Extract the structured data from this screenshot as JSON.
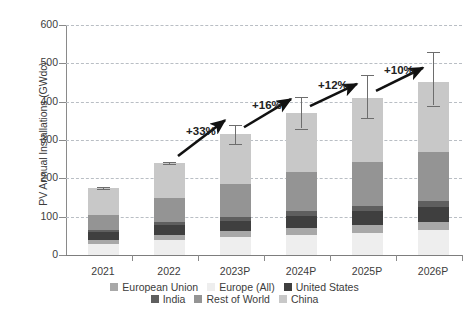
{
  "chart_data": {
    "type": "bar",
    "subtype": "stacked-bar-with-error-bars",
    "title": "",
    "xlabel": "",
    "ylabel": "PV Annual Installations (GWdc)",
    "categories": [
      "2021",
      "2022",
      "2023P",
      "2024P",
      "2025P",
      "2026P"
    ],
    "ylim": [
      0,
      600
    ],
    "yticks": [
      0,
      100,
      200,
      300,
      400,
      500,
      600
    ],
    "grid": true,
    "legend_position": "bottom",
    "stacked_order_bottom_to_top": [
      "Europe (All)",
      "European Union",
      "United States",
      "India",
      "Rest of World",
      "China"
    ],
    "series": [
      {
        "name": "Europe (All)",
        "color": "#eeeeee",
        "values": [
          28,
          38,
          46,
          52,
          58,
          64
        ]
      },
      {
        "name": "European Union",
        "color": "#a8a8a8",
        "values": [
          10,
          14,
          16,
          18,
          20,
          22
        ]
      },
      {
        "name": "United States",
        "color": "#3f3f3f",
        "values": [
          22,
          26,
          28,
          32,
          36,
          38
        ]
      },
      {
        "name": "India",
        "color": "#5f5f5f",
        "values": [
          6,
          8,
          10,
          12,
          14,
          16
        ]
      },
      {
        "name": "Rest of World",
        "color": "#949494",
        "values": [
          39,
          62,
          86,
          102,
          114,
          128
        ]
      },
      {
        "name": "China",
        "color": "#c8c8c8",
        "values": [
          70,
          92,
          129,
          154,
          168,
          184
        ]
      }
    ],
    "totals": [
      175,
      240,
      315,
      370,
      410,
      452
    ],
    "error_bars": [
      {
        "category": "2021",
        "low": 173,
        "high": 177
      },
      {
        "category": "2022",
        "low": 238,
        "high": 242
      },
      {
        "category": "2023P",
        "low": 290,
        "high": 340
      },
      {
        "category": "2024P",
        "low": 330,
        "high": 412
      },
      {
        "category": "2025P",
        "low": 358,
        "high": 470
      },
      {
        "category": "2026P",
        "low": 390,
        "high": 530
      }
    ],
    "annotations": [
      {
        "label": "+33%",
        "from": "2022",
        "to": "2023P"
      },
      {
        "label": "+16%",
        "from": "2023P",
        "to": "2024P"
      },
      {
        "label": "+12%",
        "from": "2024P",
        "to": "2025P"
      },
      {
        "label": "+10%",
        "from": "2025P",
        "to": "2026P"
      }
    ],
    "legend": [
      {
        "label": "European Union",
        "color": "#a8a8a8"
      },
      {
        "label": "Europe (All)",
        "color": "#eeeeee"
      },
      {
        "label": "United States",
        "color": "#3f3f3f"
      },
      {
        "label": "India",
        "color": "#5f5f5f"
      },
      {
        "label": "Rest of World",
        "color": "#949494"
      },
      {
        "label": "China",
        "color": "#c8c8c8"
      }
    ]
  }
}
